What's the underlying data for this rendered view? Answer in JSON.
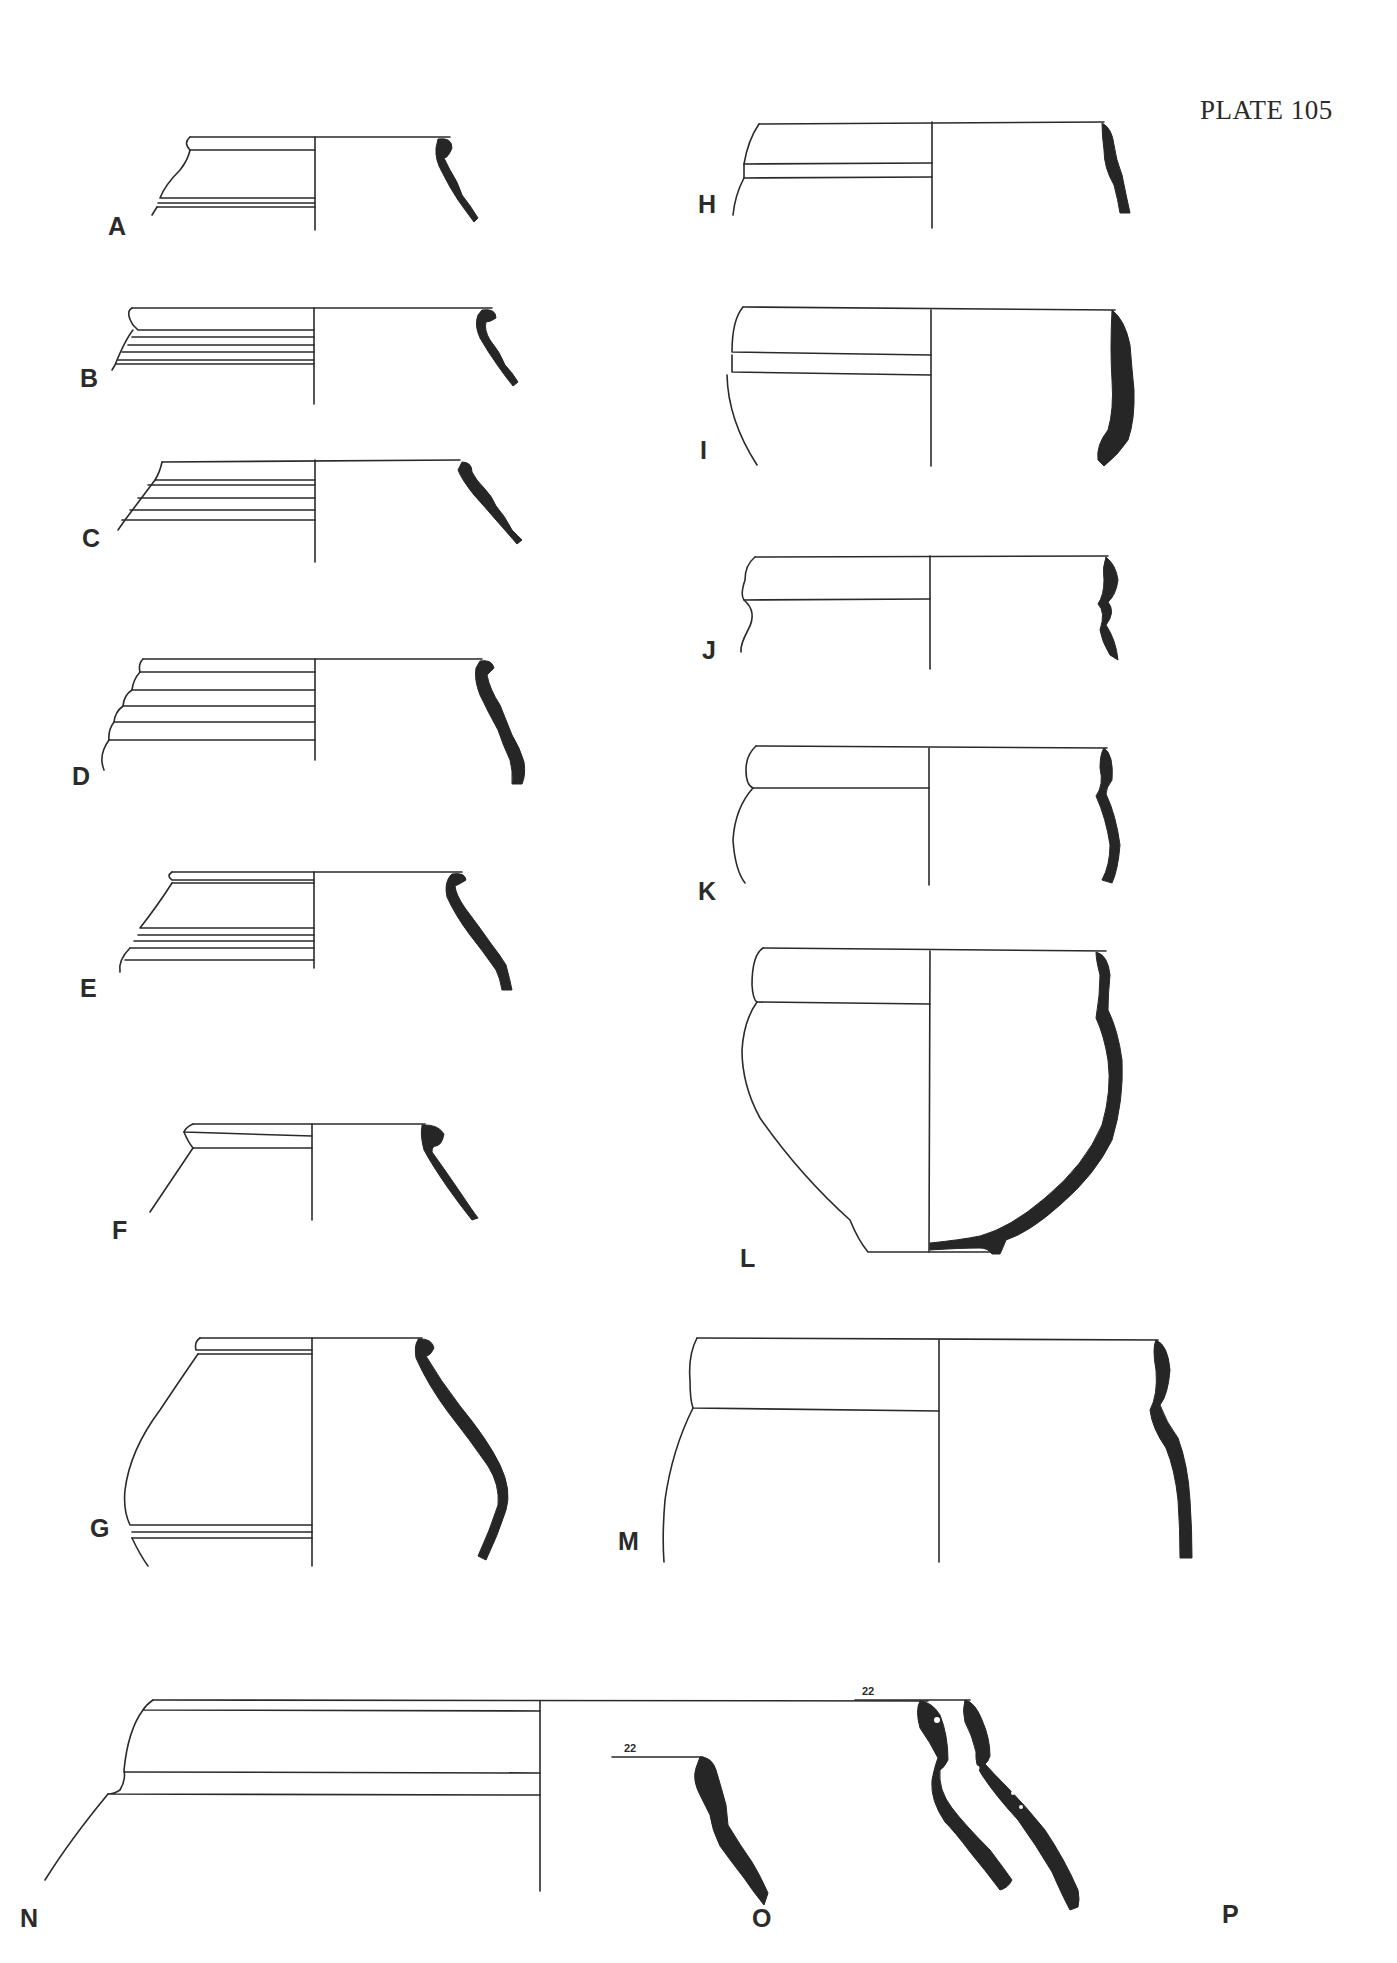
{
  "plate": {
    "title": "PLATE 105"
  },
  "figures": [
    {
      "id": "A",
      "label": "A"
    },
    {
      "id": "B",
      "label": "B"
    },
    {
      "id": "C",
      "label": "C"
    },
    {
      "id": "D",
      "label": "D"
    },
    {
      "id": "E",
      "label": "E"
    },
    {
      "id": "F",
      "label": "F"
    },
    {
      "id": "G",
      "label": "G"
    },
    {
      "id": "H",
      "label": "H"
    },
    {
      "id": "I",
      "label": "I"
    },
    {
      "id": "J",
      "label": "J"
    },
    {
      "id": "K",
      "label": "K"
    },
    {
      "id": "L",
      "label": "L"
    },
    {
      "id": "M",
      "label": "M"
    },
    {
      "id": "N",
      "label": "N"
    },
    {
      "id": "O",
      "label": "O"
    },
    {
      "id": "P",
      "label": "P"
    }
  ],
  "scale_marks": {
    "O": "22",
    "P": "22"
  },
  "colors": {
    "ink": "#262626",
    "paper": "#ffffff"
  }
}
